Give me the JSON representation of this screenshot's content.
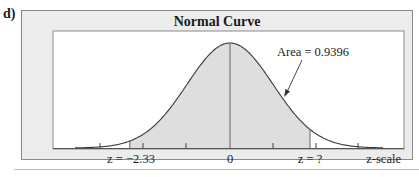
{
  "part_label": "d)",
  "chart_data": {
    "type": "area",
    "title": "Normal Curve",
    "xlabel": "z-scale",
    "ylabel": "",
    "distribution": "standard normal",
    "shaded_region": {
      "from_z": -2.33,
      "to_z": "?",
      "area": 0.9396
    },
    "annotation": "Area = 0.9396",
    "tick_labels": [
      {
        "z": -2.33,
        "label": "z = −2.33"
      },
      {
        "z": 0,
        "label": "0"
      },
      {
        "z": "?",
        "label": "z = ?"
      }
    ],
    "axis_label": "z-scale",
    "grid": false,
    "legend": null
  },
  "colors": {
    "panel_bg": "#ececec",
    "plot_bg": "#ffffff",
    "shade": "#dedede",
    "line": "#3a3a3a"
  }
}
